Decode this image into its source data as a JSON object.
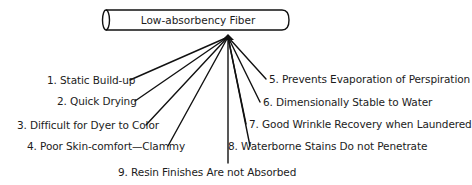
{
  "diagram": {
    "title": "Low-absorbency Fiber",
    "colors": {
      "line": "#111111",
      "text": "#1c1c1c",
      "background": "#ffffff"
    },
    "hub": {
      "x": 228,
      "y": 37
    },
    "properties": [
      {
        "num": 1,
        "label": "1. Static Build-up",
        "side": "left"
      },
      {
        "num": 2,
        "label": "2. Quick Drying",
        "side": "left"
      },
      {
        "num": 3,
        "label": "3. Difficult for Dyer to Color",
        "side": "left"
      },
      {
        "num": 4,
        "label": "4. Poor Skin-comfort—Clammy",
        "side": "left"
      },
      {
        "num": 5,
        "label": "5. Prevents Evaporation of Perspiration",
        "side": "right"
      },
      {
        "num": 6,
        "label": "6. Dimensionally Stable to Water",
        "side": "right"
      },
      {
        "num": 7,
        "label": "7. Good Wrinkle Recovery when Laundered",
        "side": "right"
      },
      {
        "num": 8,
        "label": "8. Waterborne Stains Do not Penetrate",
        "side": "right"
      },
      {
        "num": 9,
        "label": "9. Resin Finishes Are not Absorbed",
        "side": "bottom"
      }
    ]
  }
}
